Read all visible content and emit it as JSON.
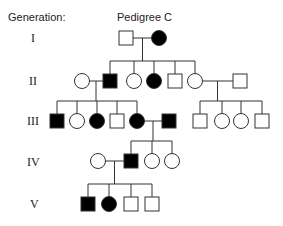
{
  "header": {
    "generation_label": "Generation:",
    "title": "Pedigree C"
  },
  "generations": [
    "I",
    "II",
    "III",
    "IV",
    "V"
  ],
  "legend_semantics": {
    "square": "male",
    "circle": "female",
    "filled": "affected",
    "open": "unaffected"
  },
  "individuals": [
    {
      "id": "I-1",
      "gen": 0,
      "sex": "male",
      "affected": false
    },
    {
      "id": "I-2",
      "gen": 0,
      "sex": "female",
      "affected": true
    },
    {
      "id": "II-spouse-a",
      "gen": 1,
      "sex": "female",
      "affected": false
    },
    {
      "id": "II-1",
      "gen": 1,
      "sex": "male",
      "affected": true
    },
    {
      "id": "II-2",
      "gen": 1,
      "sex": "female",
      "affected": false
    },
    {
      "id": "II-3",
      "gen": 1,
      "sex": "female",
      "affected": true
    },
    {
      "id": "II-4",
      "gen": 1,
      "sex": "male",
      "affected": false
    },
    {
      "id": "II-5",
      "gen": 1,
      "sex": "female",
      "affected": false
    },
    {
      "id": "II-spouse-b",
      "gen": 1,
      "sex": "male",
      "affected": false
    },
    {
      "id": "III-1",
      "gen": 2,
      "sex": "male",
      "affected": true
    },
    {
      "id": "III-2",
      "gen": 2,
      "sex": "female",
      "affected": false
    },
    {
      "id": "III-3",
      "gen": 2,
      "sex": "female",
      "affected": true
    },
    {
      "id": "III-4",
      "gen": 2,
      "sex": "male",
      "affected": false
    },
    {
      "id": "III-5",
      "gen": 2,
      "sex": "female",
      "affected": true
    },
    {
      "id": "III-spouse",
      "gen": 2,
      "sex": "male",
      "affected": true
    },
    {
      "id": "III-6",
      "gen": 2,
      "sex": "male",
      "affected": false
    },
    {
      "id": "III-7",
      "gen": 2,
      "sex": "female",
      "affected": false
    },
    {
      "id": "III-8",
      "gen": 2,
      "sex": "female",
      "affected": false
    },
    {
      "id": "III-9",
      "gen": 2,
      "sex": "male",
      "affected": false
    },
    {
      "id": "IV-spouse",
      "gen": 3,
      "sex": "female",
      "affected": false
    },
    {
      "id": "IV-1",
      "gen": 3,
      "sex": "male",
      "affected": true
    },
    {
      "id": "IV-2",
      "gen": 3,
      "sex": "female",
      "affected": false
    },
    {
      "id": "IV-3",
      "gen": 3,
      "sex": "female",
      "affected": false
    },
    {
      "id": "V-1",
      "gen": 4,
      "sex": "male",
      "affected": true
    },
    {
      "id": "V-2",
      "gen": 4,
      "sex": "female",
      "affected": true
    },
    {
      "id": "V-3",
      "gen": 4,
      "sex": "male",
      "affected": false
    },
    {
      "id": "V-4",
      "gen": 4,
      "sex": "male",
      "affected": false
    }
  ],
  "matings": [
    {
      "partners": [
        "I-1",
        "I-2"
      ],
      "children": [
        "II-1",
        "II-2",
        "II-3",
        "II-4",
        "II-5"
      ]
    },
    {
      "partners": [
        "II-spouse-a",
        "II-1"
      ],
      "children": [
        "III-1",
        "III-2",
        "III-3",
        "III-4",
        "III-5"
      ]
    },
    {
      "partners": [
        "II-5",
        "II-spouse-b"
      ],
      "children": [
        "III-6",
        "III-7",
        "III-8",
        "III-9"
      ]
    },
    {
      "partners": [
        "III-5",
        "III-spouse"
      ],
      "children": [
        "IV-1",
        "IV-2",
        "IV-3"
      ]
    },
    {
      "partners": [
        "IV-spouse",
        "IV-1"
      ],
      "children": [
        "V-1",
        "V-2",
        "V-3",
        "V-4"
      ]
    }
  ]
}
